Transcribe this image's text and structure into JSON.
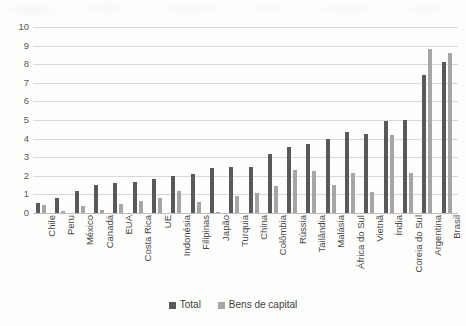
{
  "chart_data": {
    "type": "bar",
    "title": "",
    "subtitle": "",
    "xlabel": "",
    "ylabel": "",
    "ylim": [
      0,
      10
    ],
    "ytick_step": 1,
    "yticks": [
      "0",
      "1",
      "2",
      "3",
      "4",
      "5",
      "6",
      "7",
      "8",
      "9",
      "10"
    ],
    "grid": true,
    "legend_position": "bottom",
    "orientation": "vertical",
    "xtick_rotation": -90,
    "categories": [
      "Chile",
      "Peru",
      "México",
      "Canadá",
      "EUA",
      "Costa Rica",
      "UE",
      "Indonésia",
      "Filipinas",
      "Japão",
      "Turquia",
      "China",
      "Colômbia",
      "Rússia",
      "Tailândia",
      "Malásia",
      "África do Sul",
      "Vietnã",
      "Índia",
      "Coreia do Sul",
      "Argentina",
      "Brasil"
    ],
    "series": [
      {
        "name": "Total",
        "color": "#595959",
        "values": [
          0.55,
          0.8,
          1.2,
          1.5,
          1.6,
          1.65,
          1.85,
          2.0,
          2.1,
          2.4,
          2.45,
          2.5,
          3.15,
          3.55,
          3.7,
          4.0,
          4.35,
          4.25,
          4.95,
          5.0,
          7.4,
          8.1
        ]
      },
      {
        "name": "Bens de capital",
        "color": "#a6a6a6",
        "values": [
          0.45,
          0.1,
          0.4,
          0.15,
          0.5,
          0.65,
          0.8,
          1.2,
          0.6,
          0.05,
          0.9,
          1.05,
          1.45,
          2.3,
          2.25,
          1.5,
          2.15,
          1.15,
          4.2,
          2.15,
          8.8,
          8.6
        ]
      }
    ]
  },
  "legend": {
    "items": [
      {
        "label": "Total",
        "color": "#595959"
      },
      {
        "label": "Bens de capital",
        "color": "#a6a6a6"
      }
    ]
  }
}
